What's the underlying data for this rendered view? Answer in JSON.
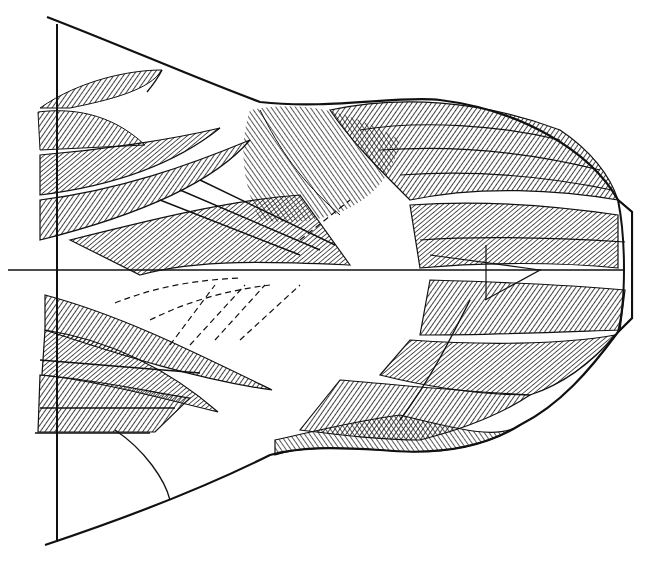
{
  "illustration": {
    "subject": "pen-and-ink drawing of a spread bird wing with feather tracts and construction lines",
    "background_color": "#ffffff",
    "ink_color": "#111111",
    "elements": [
      "vertical-axis-line",
      "horizontal-axis-line",
      "wing-outline",
      "primary-feathers",
      "secondary-feathers",
      "covert-feathers",
      "dashed-guide-lines",
      "wingtip-cap"
    ]
  }
}
